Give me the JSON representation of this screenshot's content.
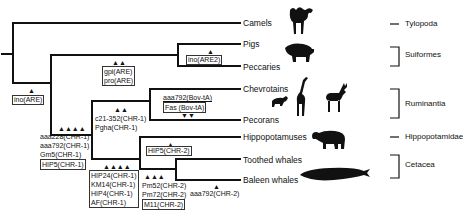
{
  "taxa": [
    {
      "name": "Camels",
      "y": 23
    },
    {
      "name": "Pigs",
      "y": 44
    },
    {
      "name": "Peccaries",
      "y": 66
    },
    {
      "name": "Chevrotains",
      "y": 89
    },
    {
      "name": "Pecorans",
      "y": 120
    },
    {
      "name": "Hippopotamuses",
      "y": 137
    },
    {
      "name": "Toothed whales",
      "y": 159
    },
    {
      "name": "Baleen whales",
      "y": 180
    }
  ],
  "groups": [
    {
      "name": "Tylopoda"
    },
    {
      "name": "Suiformes"
    },
    {
      "name": "Ruminantia"
    },
    {
      "name": "Hippopotamidae"
    },
    {
      "name": "Cetacea"
    }
  ],
  "markers": {
    "root": {
      "triangles": "▲",
      "lines": [
        "ino(ARE)"
      ]
    },
    "suiformes_stem": {
      "triangles": "▲▲",
      "lines": [
        "gpi(ARE)",
        "pro(ARE)"
      ]
    },
    "pigs_peccaries": {
      "triangles": "▲",
      "lines": [
        "ino(ARE2)"
      ]
    },
    "ruminantia_cetacea_stem": {
      "triangles": "▲▲▲▲",
      "lines": [
        "aaa228(CHR-1)",
        "aaa792(CHR-1)",
        "Gm5(CHR-1)",
        "HIP5(CHR-1)"
      ]
    },
    "ruminantia_stem": {
      "triangles": "▲▲",
      "lines": [
        "c21-352(CHR-1)",
        "Pgha(CHR-1)"
      ]
    },
    "pecorans": {
      "triangles": "▼▼",
      "lines": [
        "aaa792(Bov-tA)",
        "Fas (Bov-tA)"
      ]
    },
    "hippo_cetacea_stem": {
      "triangles": "▲▲▲▲",
      "lines": [
        "HIP24(CHR-1)",
        "KM14(CHR-1)",
        "HIP4(CHR-1)",
        "AF(CHR-1)"
      ]
    },
    "hippo": {
      "triangles": "▲",
      "lines": [
        "HIP5(CHR-2)"
      ]
    },
    "cetacea_stem": {
      "triangles": "▲▲▲",
      "lines": [
        "Pm52(CHR-2)",
        "Pm72(CHR-2)",
        "M11(CHR-2)"
      ]
    },
    "baleen": {
      "triangles": "▲",
      "lines": [
        "aaa792(CHR-2)"
      ]
    }
  },
  "silhouettes": [
    "camel-icon",
    "pig-icon",
    "chevrotain-icon",
    "giraffe-icon",
    "deer-icon",
    "hippo-icon",
    "whale-icon"
  ]
}
